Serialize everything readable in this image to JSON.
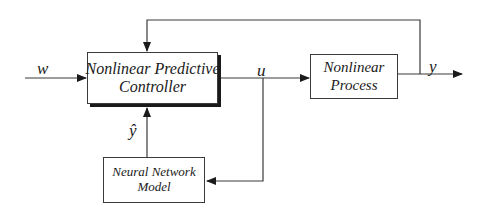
{
  "diagram": {
    "blocks": {
      "controller": {
        "line1": "Nonlinear Predictive",
        "line2": "Controller"
      },
      "process": {
        "line1": "Nonlinear",
        "line2": "Process"
      },
      "model": {
        "line1": "Neural Network",
        "line2": "Model"
      }
    },
    "signals": {
      "reference": "w",
      "control": "u",
      "output": "y",
      "predicted_output": "ŷ"
    },
    "colors": {
      "line": "#3a3a3a",
      "text": "#1a1a1a",
      "background": "#ffffff"
    }
  }
}
